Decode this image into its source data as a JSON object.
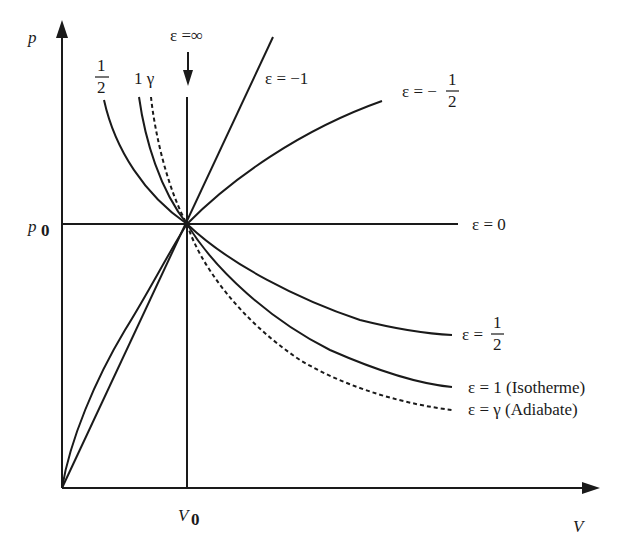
{
  "diagram": {
    "axes": {
      "x_label": "V",
      "y_label": "p",
      "x_ref_label": "V",
      "x_ref_sub": "0",
      "y_ref_label": "p",
      "y_ref_sub": "0"
    },
    "top_labels": {
      "eps_inf": "ε =∞",
      "half_num": "1",
      "half_den": "2",
      "one_gamma": "1 γ",
      "eps_minus_one": "ε = −1",
      "eps_minus_half_prefix": "ε = −",
      "eps_minus_half_num": "1",
      "eps_minus_half_den": "2"
    },
    "right_labels": {
      "eps_zero": "ε = 0",
      "eps_half_prefix": "ε =",
      "eps_half_num": "1",
      "eps_half_den": "2",
      "eps_one": "ε =  1 (Isotherme)",
      "eps_gamma": "ε =  γ  (Adiabate)"
    },
    "curves": [
      {
        "name": "epsilon = infinity (isochore)",
        "exponent": "∞",
        "style": "solid"
      },
      {
        "name": "epsilon = -1",
        "exponent": -1,
        "style": "solid"
      },
      {
        "name": "epsilon = -1/2",
        "exponent": -0.5,
        "style": "solid"
      },
      {
        "name": "epsilon = 0 (isobar)",
        "exponent": 0,
        "style": "solid"
      },
      {
        "name": "epsilon = 1/2",
        "exponent": 0.5,
        "style": "solid"
      },
      {
        "name": "epsilon = 1 (Isotherme)",
        "exponent": 1,
        "style": "solid"
      },
      {
        "name": "epsilon = gamma (Adiabate)",
        "exponent": "γ",
        "style": "dashed"
      }
    ],
    "colors": {
      "ink": "#1a1a1a",
      "background": "#ffffff"
    }
  }
}
